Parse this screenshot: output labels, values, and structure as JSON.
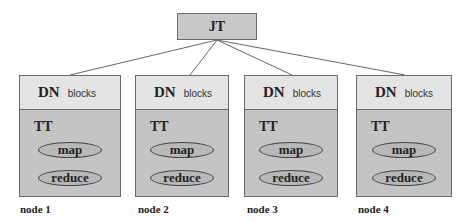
{
  "diagram": {
    "root": {
      "label": "JT"
    },
    "nodes": [
      {
        "caption": "node 1",
        "dn_label": "DN",
        "blocks_label": "blocks",
        "tt_label": "TT",
        "tasks": [
          "map",
          "reduce"
        ]
      },
      {
        "caption": "node 2",
        "dn_label": "DN",
        "blocks_label": "blocks",
        "tt_label": "TT",
        "tasks": [
          "map",
          "reduce"
        ]
      },
      {
        "caption": "node 3",
        "dn_label": "DN",
        "blocks_label": "blocks",
        "tt_label": "TT",
        "tasks": [
          "map",
          "reduce"
        ]
      },
      {
        "caption": "node 4",
        "dn_label": "DN",
        "blocks_label": "blocks",
        "tt_label": "TT",
        "tasks": [
          "map",
          "reduce"
        ]
      }
    ],
    "colors": {
      "root_fill": "#c8c8c8",
      "dn_fill": "#e4e4e4",
      "tt_fill": "#c4c4c4",
      "oval_fill": "#b8b8b8",
      "border": "#6a6a6a"
    }
  }
}
